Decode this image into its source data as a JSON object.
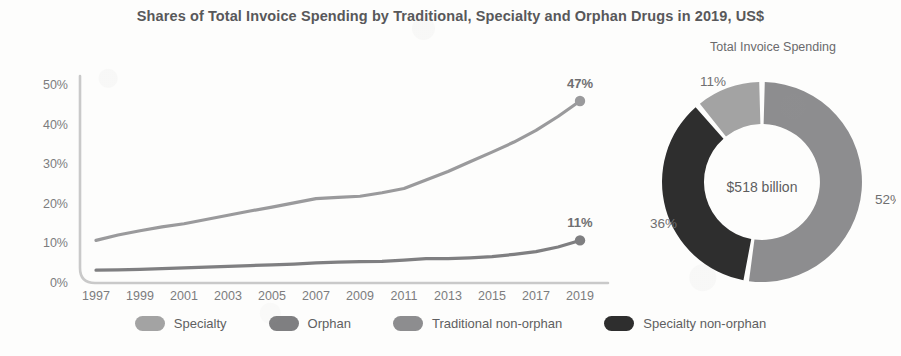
{
  "header": {
    "title": "Shares of Total Invoice Spending by Traditional, Specialty and Orphan Drugs in 2019, US$"
  },
  "donut": {
    "title": "Total Invoice Spending",
    "center_label": "$518 billion",
    "labels": {
      "traditional": "52%",
      "specialty_non_orphan": "36%",
      "orphan": "11%"
    }
  },
  "legend": {
    "items": [
      {
        "label": "Specialty",
        "color": "#a3a3a3"
      },
      {
        "label": "Orphan",
        "color": "#7f7f81"
      },
      {
        "label": "Traditional non-orphan",
        "color": "#8d8d8f"
      },
      {
        "label": "Specialty non-orphan",
        "color": "#2e2e2e"
      }
    ]
  },
  "axis": {
    "y_ticks": [
      "0%",
      "10%",
      "20%",
      "30%",
      "40%",
      "50%"
    ],
    "x_ticks": [
      "1997",
      "1999",
      "2001",
      "2003",
      "2005",
      "2007",
      "2009",
      "2011",
      "2013",
      "2015",
      "2017",
      "2019"
    ]
  },
  "endpoint_labels": {
    "specialty": "47%",
    "orphan": "11%"
  },
  "chart_data": [
    {
      "type": "line",
      "title": "Shares of Total Invoice Spending by Traditional, Specialty and Orphan Drugs in 2019, US$",
      "xlabel": "",
      "ylabel": "",
      "ylim": [
        0,
        50
      ],
      "xlim": [
        1997,
        2019
      ],
      "grid": false,
      "legend_position": "bottom",
      "ytick_labels": [
        "0%",
        "10%",
        "20%",
        "30%",
        "40%",
        "50%"
      ],
      "ytick_values": [
        0,
        10,
        20,
        30,
        40,
        50
      ],
      "xtick_labels": [
        "1997",
        "1999",
        "2001",
        "2003",
        "2005",
        "2007",
        "2009",
        "2011",
        "2013",
        "2015",
        "2017",
        "2019"
      ],
      "x": [
        1997,
        1998,
        1999,
        2000,
        2001,
        2002,
        2003,
        2004,
        2005,
        2006,
        2007,
        2008,
        2009,
        2010,
        2011,
        2012,
        2013,
        2014,
        2015,
        2016,
        2017,
        2018,
        2019
      ],
      "series": [
        {
          "name": "Specialty",
          "color": "#9a9a9c",
          "end_label": "47%",
          "values": [
            11.0,
            12.4,
            13.5,
            14.5,
            15.3,
            16.4,
            17.5,
            18.6,
            19.6,
            20.7,
            21.8,
            22.1,
            22.4,
            23.3,
            24.4,
            26.6,
            28.8,
            31.3,
            33.8,
            36.4,
            39.4,
            43.0,
            47.0
          ]
        },
        {
          "name": "Orphan",
          "color": "#7f7f81",
          "end_label": "11%",
          "values": [
            3.3,
            3.4,
            3.5,
            3.7,
            3.9,
            4.1,
            4.3,
            4.5,
            4.7,
            4.9,
            5.2,
            5.4,
            5.5,
            5.6,
            5.9,
            6.3,
            6.3,
            6.5,
            6.8,
            7.4,
            8.1,
            9.3,
            11.0
          ]
        }
      ]
    },
    {
      "type": "pie",
      "title": "Total Invoice Spending",
      "center_label": "$518 billion",
      "donut": true,
      "labels": [
        "Traditional non-orphan",
        "Specialty non-orphan",
        "Orphan"
      ],
      "values": [
        52,
        36,
        11
      ],
      "value_labels": [
        "52%",
        "36%",
        "11%"
      ],
      "colors": [
        "#8d8d8f",
        "#2e2e2e",
        "#a3a3a3"
      ],
      "legend_position": "bottom"
    }
  ]
}
